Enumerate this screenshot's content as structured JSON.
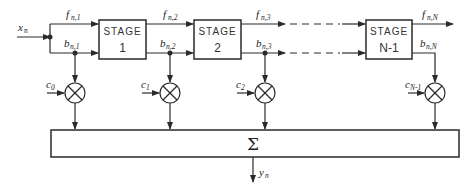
{
  "diagram": {
    "input": {
      "label": "x",
      "sub": "n"
    },
    "output": {
      "label": "y",
      "sub": "n"
    },
    "stages": [
      {
        "title": "STAGE",
        "number": "1"
      },
      {
        "title": "STAGE",
        "number": "2"
      },
      {
        "title": "STAGE",
        "number": "N-1"
      }
    ],
    "forward_signals": [
      {
        "label": "f",
        "sub": "n,1"
      },
      {
        "label": "f",
        "sub": "n,2"
      },
      {
        "label": "f",
        "sub": "n,3"
      },
      {
        "label": "f",
        "sub": "n,N"
      }
    ],
    "backward_signals": [
      {
        "label": "b",
        "sub": "n,1"
      },
      {
        "label": "b",
        "sub": "n,2"
      },
      {
        "label": "b",
        "sub": "n,3"
      },
      {
        "label": "b",
        "sub": "n,N"
      }
    ],
    "coefficients": [
      {
        "label": "c",
        "sub": "0"
      },
      {
        "label": "c",
        "sub": "1"
      },
      {
        "label": "c",
        "sub": "2"
      },
      {
        "label": "c",
        "sub": "N-1"
      }
    ],
    "summer": {
      "symbol": "Σ"
    },
    "colors": {
      "line": "#2a2a2a",
      "background": "#ffffff"
    }
  }
}
